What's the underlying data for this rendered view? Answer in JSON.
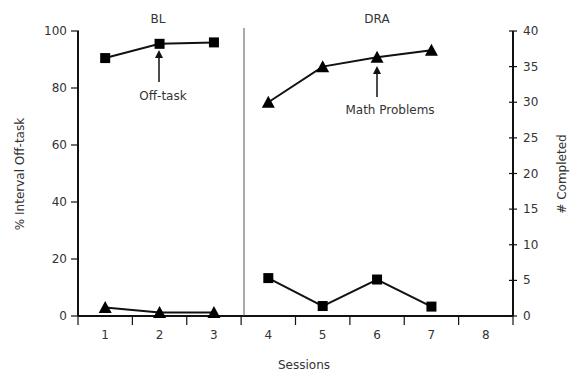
{
  "chart_data": {
    "type": "line",
    "title": "",
    "xlabel": "Sessions",
    "ylabel": "% Interval Off-task",
    "y2label": "# Completed",
    "x": [
      1,
      2,
      3,
      4,
      5,
      6,
      7,
      8
    ],
    "xticks": [
      "1",
      "2",
      "3",
      "4",
      "5",
      "6",
      "7",
      "8"
    ],
    "ylim": [
      0,
      100
    ],
    "yticks": [
      "0",
      "20",
      "40",
      "60",
      "80",
      "100"
    ],
    "y2lim": [
      0,
      40
    ],
    "y2ticks": [
      "0",
      "5",
      "10",
      "15",
      "20",
      "25",
      "30",
      "35",
      "40"
    ],
    "grid": false,
    "phases": [
      {
        "label": "BL",
        "sessions": [
          1,
          3
        ]
      },
      {
        "label": "DRA",
        "sessions": [
          4,
          8
        ]
      }
    ],
    "series": [
      {
        "name": "Off-task",
        "axis": "left",
        "marker": "square",
        "phase_segments": [
          {
            "x": [
              1,
              2,
              3
            ],
            "values": [
              90.5,
              95.5,
              96
            ]
          },
          {
            "x": [
              4,
              5,
              6,
              7
            ],
            "values": [
              13.3,
              3.5,
              12.8,
              3.3
            ]
          }
        ]
      },
      {
        "name": "Math Problems",
        "axis": "right",
        "marker": "triangle",
        "phase_segments": [
          {
            "x": [
              1,
              2,
              3
            ],
            "values": [
              1.2,
              0.5,
              0.5
            ]
          },
          {
            "x": [
              4,
              5,
              6,
              7
            ],
            "values": [
              30,
              35,
              36.3,
              37.3
            ]
          }
        ]
      }
    ],
    "annotations": [
      {
        "text": "Off-task",
        "points_to": {
          "series": "Off-task",
          "x": 2
        }
      },
      {
        "text": "Math Problems",
        "points_to": {
          "series": "Math Problems",
          "x": 6
        }
      }
    ]
  }
}
